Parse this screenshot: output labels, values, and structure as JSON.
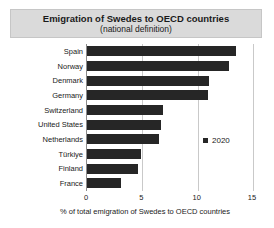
{
  "title": "Emigration of Swedes to OECD countries",
  "subtitle": "(national definition)",
  "legend": {
    "label": "2020",
    "marker_icon": "square-swatch-icon"
  },
  "colors": {
    "bar": "#262626",
    "gridline": "#c9c9c9",
    "axis": "#8c8c8c",
    "title_box_bg": "#dadada",
    "title_box_border": "#c6c6c6",
    "text": "#1a1a1a"
  },
  "chart_data": {
    "type": "bar",
    "orientation": "horizontal",
    "title": "Emigration of Swedes to OECD countries",
    "subtitle": "(national definition)",
    "categories": [
      "Spain",
      "Norway",
      "Denmark",
      "Germany",
      "Switzerland",
      "United States",
      "Netherlands",
      "Türkiye",
      "Finland",
      "France"
    ],
    "series": [
      {
        "name": "2020",
        "values": [
          13.5,
          12.8,
          11.0,
          10.9,
          6.9,
          6.7,
          6.5,
          4.9,
          4.6,
          3.1
        ]
      }
    ],
    "xlabel": "% of total emigration of Swedes to OECD countries",
    "ylabel": "",
    "xlim": [
      0,
      15
    ],
    "xticks": [
      0,
      5,
      10,
      15
    ],
    "grid": "vertical",
    "legend_position": "right-middle"
  }
}
